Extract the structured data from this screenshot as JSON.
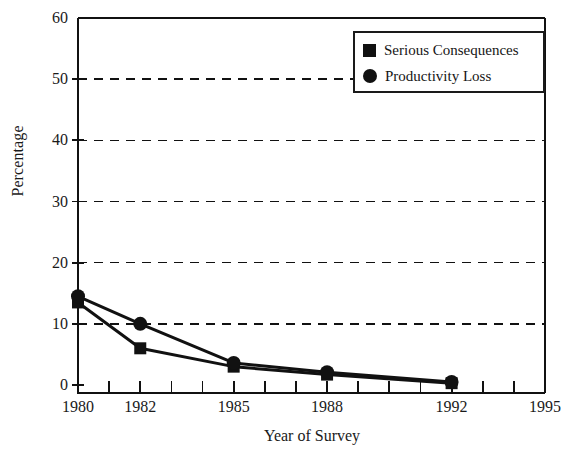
{
  "chart_data": {
    "type": "line",
    "title": "",
    "xlabel": "Year of Survey",
    "ylabel": "Percentage",
    "x": [
      1980,
      1982,
      1985,
      1988,
      1992
    ],
    "xlim": [
      1980,
      1995
    ],
    "ylim": [
      0,
      60
    ],
    "grid": "horizontal-dashed",
    "legend_position": "top-right",
    "x_ticks_all": [
      1980,
      1981,
      1982,
      1983,
      1984,
      1985,
      1986,
      1987,
      1988,
      1989,
      1990,
      1991,
      1992,
      1993,
      1994,
      1995
    ],
    "x_tick_labels": [
      "1980",
      "1982",
      "1985",
      "1988",
      "1992",
      "1995"
    ],
    "x_tick_label_values": [
      1980,
      1982,
      1985,
      1988,
      1992,
      1995
    ],
    "y_ticks": [
      0,
      10,
      20,
      30,
      40,
      50,
      60
    ],
    "y_tick_labels": [
      "0",
      "10",
      "20",
      "30",
      "40",
      "50",
      "60"
    ],
    "gridline_values": [
      10,
      20,
      30,
      40,
      50
    ],
    "series": [
      {
        "name": "Serious Consequences",
        "marker": "square",
        "color": "#111111",
        "values": [
          13.5,
          6.0,
          3.0,
          1.7,
          0.3
        ]
      },
      {
        "name": "Productivity Loss",
        "marker": "circle",
        "color": "#111111",
        "values": [
          14.5,
          10.0,
          3.6,
          2.1,
          0.5
        ]
      }
    ]
  },
  "axes": {
    "y_title": "Percentage",
    "x_title": "Year of Survey"
  },
  "legend": {
    "items": [
      {
        "label": "Serious Consequences",
        "marker": "square"
      },
      {
        "label": "Productivity Loss",
        "marker": "circle"
      }
    ]
  },
  "colors": {
    "ink": "#111111",
    "background": "#ffffff"
  }
}
